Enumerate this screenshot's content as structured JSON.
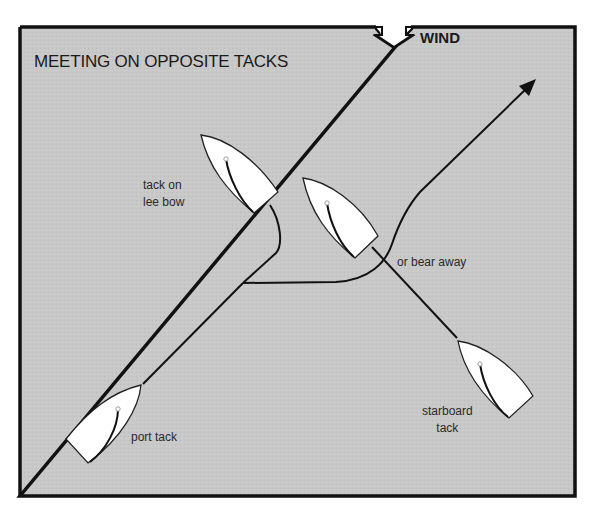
{
  "title": "MEETING ON OPPOSITE TACKS",
  "wind_label": "WIND",
  "labels": {
    "lee_bow": "tack on\nlee bow",
    "bear_away": "or bear away",
    "starboard": "starboard\ntack",
    "port": "port tack"
  },
  "colors": {
    "background": "#c9c9c9",
    "border": "#111111",
    "boat_fill": "#ffffff",
    "line": "#111111"
  }
}
